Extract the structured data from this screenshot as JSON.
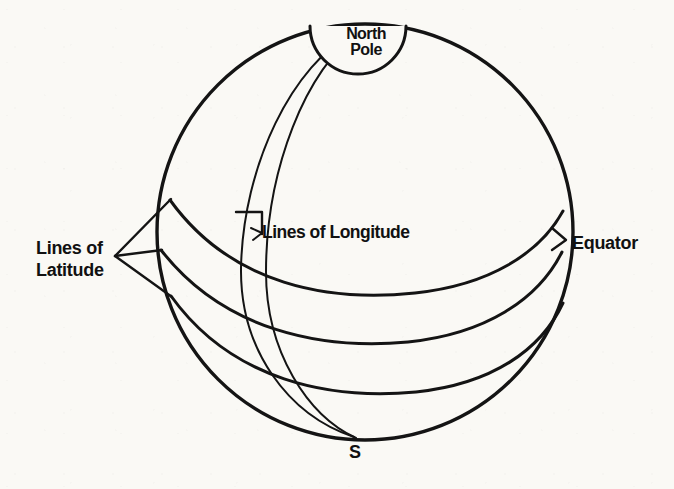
{
  "figure": {
    "kind": "globe-latitude-longitude-diagram",
    "background_color": "#faf9f5",
    "ink_color": "#141414"
  },
  "labels": {
    "north_pole_line1": "North",
    "north_pole_line2": "Pole",
    "lines_of_longitude": "Lines of Longitude",
    "lines_of_latitude_line1": "Lines of",
    "lines_of_latitude_line2": "Latitude",
    "equator": "Equator",
    "south_pole": "S"
  },
  "geometry": {
    "globe": {
      "cx": 365,
      "cy": 232,
      "r": 208
    },
    "north_pole_cap": {
      "cx": 358,
      "cy": 26,
      "r": 48
    },
    "north_pole_point": {
      "x": 358,
      "y": 30
    },
    "south_pole_point": {
      "x": 355,
      "y": 438
    },
    "latitude_line_count": 3,
    "longitude_line_count": 2,
    "latitude_names": [
      "Equator",
      "Mid latitude",
      "Low latitude"
    ],
    "leader_fan_origin": {
      "x": 113,
      "y": 256
    }
  }
}
